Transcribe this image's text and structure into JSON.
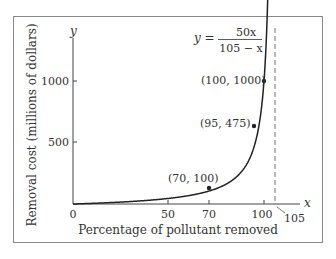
{
  "chart_data": {
    "type": "line",
    "title": "",
    "equation": {
      "lhs": "y =",
      "numerator": "50x",
      "denominator": "105 − x"
    },
    "xlabel": "Percentage of pollutant removed",
    "ylabel": "Removal cost (millions of dollars)",
    "x_axis_var": "x",
    "y_axis_var": "y",
    "xlim": [
      0,
      105
    ],
    "ylim": [
      0,
      1250
    ],
    "x_ticks": [
      0,
      50,
      70,
      100
    ],
    "x_tick_labels": [
      "0",
      "50",
      "70",
      "100"
    ],
    "y_ticks": [
      500,
      1000
    ],
    "y_tick_labels": [
      "500",
      "1000"
    ],
    "asymptote": {
      "x": 105,
      "label": "105",
      "style": "dashed"
    },
    "grid": false,
    "series": [
      {
        "name": "y = 50x / (105 - x)",
        "function": "50*x/(105-x)",
        "x_range": [
          0,
          103.05
        ]
      }
    ],
    "points": [
      {
        "x": 70,
        "y": 100,
        "label": "(70, 100)"
      },
      {
        "x": 95,
        "y": 475,
        "label": "(95, 475)"
      },
      {
        "x": 100,
        "y": 1000,
        "label": "(100, 1000)"
      }
    ]
  }
}
